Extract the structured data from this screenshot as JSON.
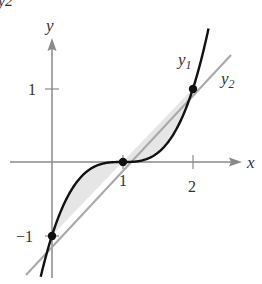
{
  "figure": {
    "type": "function-graph",
    "top_clipped_label": "y2",
    "axes": {
      "x_label": "x",
      "y_label": "y",
      "x_ticks": [
        {
          "value": 1,
          "label": "1"
        },
        {
          "value": 2,
          "label": "2"
        }
      ],
      "y_ticks": [
        {
          "value": 1,
          "label": "1"
        },
        {
          "value": -1,
          "label": "−1"
        }
      ]
    },
    "curves": [
      {
        "name": "y1",
        "label_main": "y",
        "label_sub": "1",
        "expression": "(x-1)^3",
        "color": "#111111"
      },
      {
        "name": "y2",
        "label_main": "y",
        "label_sub": "2",
        "expression": "x-1",
        "color": "#a0a0a0"
      }
    ],
    "intersection_points": [
      {
        "x": 0,
        "y": -1
      },
      {
        "x": 1,
        "y": 0
      },
      {
        "x": 2,
        "y": 1
      }
    ],
    "shaded_region_color": "#e6e6e6",
    "axis_color": "#8a8a8a"
  }
}
